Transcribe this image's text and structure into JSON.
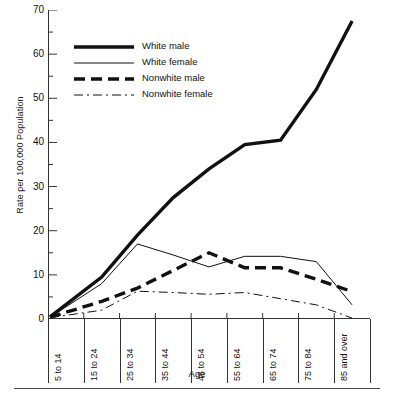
{
  "chart_data": {
    "type": "line",
    "title": "",
    "xlabel": "Age",
    "ylabel": "Rate per 100,000 Population",
    "categories": [
      "5 to 14",
      "15 to 24",
      "25 to 34",
      "35 to 44",
      "45 to 54",
      "55 to 64",
      "65 to 74",
      "75 to 84",
      "85 and over"
    ],
    "ylim": [
      0,
      70
    ],
    "yticks": [
      0,
      10,
      20,
      30,
      40,
      50,
      60,
      70
    ],
    "yticks_minor": [
      5,
      15,
      25,
      35,
      45,
      55,
      65
    ],
    "grid": false,
    "legend_position": "upper left inside plot",
    "series": [
      {
        "name": "White male",
        "style": "thick-solid",
        "values": [
          0.5,
          9.5,
          19.0,
          27.5,
          34.0,
          39.5,
          40.5,
          52.0,
          67.5
        ]
      },
      {
        "name": "White female",
        "style": "thin-solid",
        "values": [
          0.4,
          8.0,
          17.0,
          14.5,
          11.8,
          14.2,
          14.2,
          13.0,
          3.2
        ]
      },
      {
        "name": "Nonwhite male",
        "style": "thick-dashed",
        "values": [
          0.4,
          4.0,
          7.0,
          11.0,
          15.0,
          11.6,
          11.6,
          9.0,
          6.2
        ]
      },
      {
        "name": "Nonwhite female",
        "style": "thin-dashdot",
        "values": [
          0.3,
          2.0,
          6.3,
          6.0,
          5.6,
          6.0,
          4.6,
          3.2,
          0.2
        ]
      }
    ]
  },
  "yaxis": {
    "labels": [
      "70",
      "60",
      "50",
      "40",
      "30",
      "20",
      "10",
      "0"
    ],
    "title": "Rate per 100,000 Population"
  },
  "xaxis": {
    "title": "Age",
    "labels": [
      "5 to 14",
      "15 to 24",
      "25 to 34",
      "35 to 44",
      "45 to 54",
      "55 to 64",
      "65 to 74",
      "75 to 84",
      "85 and over"
    ]
  },
  "legend": {
    "items": [
      {
        "label": "White male"
      },
      {
        "label": "White female"
      },
      {
        "label": "Nonwhite male"
      },
      {
        "label": "Nonwhite female"
      }
    ]
  },
  "colors": {
    "ink": "#111111",
    "axis": "#333333",
    "background": "#ffffff"
  }
}
